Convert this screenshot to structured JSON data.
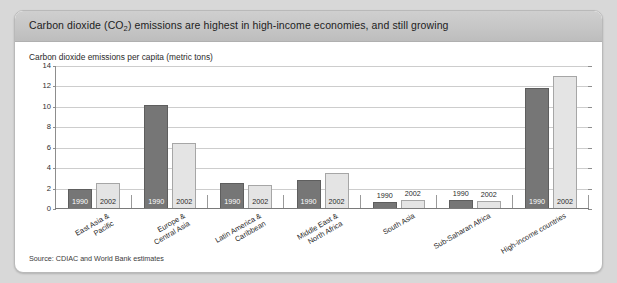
{
  "header": {
    "title_before": "Carbon dioxide (CO",
    "title_sub": "2",
    "title_after": ") emissions are highest in high-income economies, and still growing"
  },
  "subtitle": "Carbon dioxide emissions per capita (metric tons)",
  "source": "Source: CDIAC and World Bank estimates",
  "colors": {
    "bar_1990": "#767676",
    "bar_2002": "#e4e4e4",
    "panel_bg": "#ffffff",
    "header_bg": "#c6c6c6",
    "page_bg": "#d8d8d8",
    "gridline": "#cdcdcd",
    "axis": "#8d8d8d"
  },
  "chart_data": {
    "type": "bar",
    "title": "Carbon dioxide (CO2) emissions are highest in high-income economies, and still growing",
    "subtitle": "Carbon dioxide emissions per capita (metric tons)",
    "xlabel": "",
    "ylabel": "Carbon dioxide emissions per capita (metric tons)",
    "ylim": [
      0,
      14
    ],
    "yticks": [
      0,
      2,
      4,
      6,
      8,
      10,
      12,
      14
    ],
    "grid": true,
    "legend": "none",
    "bar_value_labels": [
      "1990",
      "2002"
    ],
    "categories": [
      "East Asia & Pacific",
      "Europe & Central Asia",
      "Latin America & Caribbean",
      "Middle East & North Africa",
      "South Asia",
      "Sub-Saharan Africa",
      "High-income countries"
    ],
    "series": [
      {
        "name": "1990",
        "values": [
          2.0,
          10.2,
          2.5,
          2.8,
          0.7,
          0.9,
          11.8
        ]
      },
      {
        "name": "2002",
        "values": [
          2.5,
          6.5,
          2.4,
          3.5,
          0.9,
          0.8,
          13.0
        ]
      }
    ]
  }
}
